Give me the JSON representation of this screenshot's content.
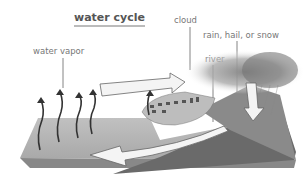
{
  "title": "water cycle",
  "labels": {
    "cloud": "cloud",
    "precipitation": "rain, hail, or snow",
    "water_vapor": "water vapor",
    "river": "river"
  },
  "colors": {
    "text": "#777777",
    "title": "#555555",
    "water": "#b8b8b8",
    "land": "#6e6e6e",
    "arrow_fill": "#f4f4f4"
  }
}
